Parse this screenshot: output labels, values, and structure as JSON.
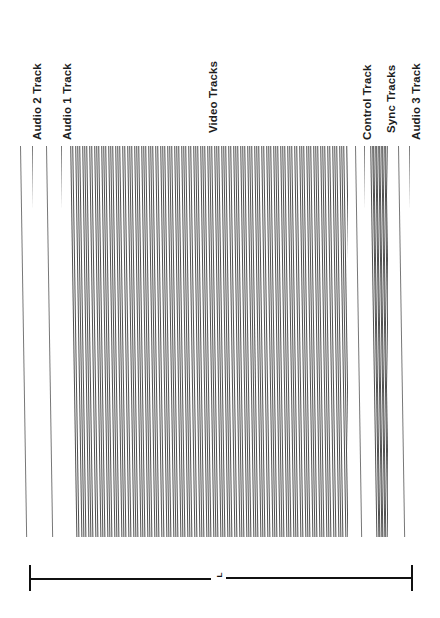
{
  "figure": {
    "orientation": "labels-rotated-90-ccw",
    "background_color": "#ffffff",
    "ink_color": "#1a1a1a"
  },
  "labels": [
    {
      "id": "audio-2-track",
      "text": "Audio 2 Track",
      "x": 32,
      "y": 140
    },
    {
      "id": "audio-1-track",
      "text": "Audio 1 Track",
      "x": 62,
      "y": 140
    },
    {
      "id": "video-tracks",
      "text": "Video Tracks",
      "x": 208,
      "y": 133
    },
    {
      "id": "control-track",
      "text": "Control Track",
      "x": 362,
      "y": 140
    },
    {
      "id": "sync-tracks",
      "text": "Sync Tracks",
      "x": 386,
      "y": 133
    },
    {
      "id": "audio-3-track",
      "text": "Audio 3 Track",
      "x": 411,
      "y": 140
    }
  ],
  "bands": [
    {
      "id": "audio-2-band",
      "name": "Audio 2 Track",
      "left": 20,
      "top": 146,
      "width": 13,
      "stripe_count": 2,
      "stripe_color": "#777777",
      "kind": "edge-lines"
    },
    {
      "id": "audio-1-band",
      "name": "Audio 1 Track",
      "left": 46,
      "top": 146,
      "width": 16,
      "stripe_count": 2,
      "stripe_color": "#777777",
      "kind": "edge-lines"
    },
    {
      "id": "video-band",
      "name": "Video Tracks",
      "left": 70,
      "top": 146,
      "width": 278,
      "stripe_count": 118,
      "stripe_color": "#4f4f4f",
      "kind": "dense-stripes"
    },
    {
      "id": "control-band",
      "name": "Control Track",
      "left": 355,
      "top": 146,
      "width": 10,
      "stripe_count": 2,
      "stripe_color": "#777777",
      "kind": "edge-lines"
    },
    {
      "id": "sync-band",
      "name": "Sync Tracks",
      "left": 370,
      "top": 146,
      "width": 18,
      "stripe_count": 12,
      "stripe_color": "#4f4f4f",
      "kind": "dense-stripes"
    },
    {
      "id": "audio-3-band",
      "name": "Audio 3 Track",
      "left": 398,
      "top": 146,
      "width": 12,
      "stripe_count": 2,
      "stripe_color": "#777777",
      "kind": "edge-lines"
    }
  ],
  "field": {
    "top": 146,
    "bottom": 537,
    "stripe_slant_deg": -0.9
  },
  "dimension": {
    "id": "tape-length-dimension",
    "label": "L",
    "left_x": 29,
    "right_x": 411,
    "y": 578,
    "cap_height": 26,
    "label_x": 218,
    "label_y": 571,
    "gap_start": 211,
    "gap_end": 226
  }
}
